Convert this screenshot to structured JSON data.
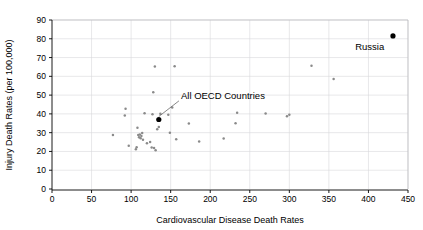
{
  "chart_data": {
    "type": "scatter",
    "title": "",
    "xlabel": "Cardiovascular Disease Death Rates",
    "ylabel": "Injury Death Rates (per 100,000)",
    "xlim": [
      0,
      450
    ],
    "ylim": [
      0,
      90
    ],
    "xticks": [
      0,
      50,
      100,
      150,
      200,
      250,
      300,
      350,
      400,
      450
    ],
    "yticks": [
      0,
      10,
      20,
      30,
      40,
      50,
      60,
      70,
      80,
      90
    ],
    "xtick_labels": [
      "0",
      "50",
      "100",
      "150",
      "200",
      "250",
      "300",
      "350",
      "400",
      "450"
    ],
    "ytick_labels": [
      "0",
      "10",
      "20",
      "30",
      "40",
      "50",
      "60",
      "70",
      "80",
      "90"
    ],
    "grid": true,
    "legend": "none",
    "series": [
      {
        "name": "OECD member countries",
        "marker": "small-gray-dot",
        "color": "#8a8a8a",
        "points": [
          [
            77,
            28.8
          ],
          [
            92,
            39.2
          ],
          [
            93,
            42.7
          ],
          [
            97,
            23.0
          ],
          [
            106,
            21.2
          ],
          [
            107,
            22.3
          ],
          [
            108,
            32.6
          ],
          [
            109,
            28.8
          ],
          [
            110,
            27.6
          ],
          [
            111,
            29.0
          ],
          [
            112,
            27.0
          ],
          [
            113,
            28.2
          ],
          [
            114,
            29.8
          ],
          [
            115,
            26.2
          ],
          [
            117,
            40.3
          ],
          [
            120,
            24.4
          ],
          [
            124,
            25.0
          ],
          [
            126,
            22.1
          ],
          [
            127,
            39.8
          ],
          [
            128,
            51.5
          ],
          [
            129,
            21.8
          ],
          [
            130,
            65.3
          ],
          [
            131,
            20.7
          ],
          [
            133,
            31.8
          ],
          [
            135,
            33.0
          ],
          [
            137,
            40.1
          ],
          [
            147,
            39.5
          ],
          [
            149,
            30.0
          ],
          [
            152,
            43.4
          ],
          [
            155,
            65.4
          ],
          [
            157,
            26.5
          ],
          [
            173,
            34.9
          ],
          [
            186,
            25.3
          ],
          [
            217,
            26.9
          ],
          [
            232,
            35.0
          ],
          [
            234,
            40.6
          ],
          [
            270,
            40.2
          ],
          [
            297,
            38.7
          ],
          [
            300,
            39.5
          ],
          [
            328,
            65.7
          ],
          [
            356,
            58.6
          ]
        ]
      },
      {
        "name": "Highlighted",
        "marker": "large-black-dot",
        "color": "#000000",
        "points": [
          [
            431,
            81.5
          ],
          [
            135,
            37.0
          ]
        ],
        "labels": [
          "Russia",
          "All OECD Countries"
        ]
      }
    ],
    "annotations": [
      {
        "text": "Russia",
        "point": [
          431,
          81.5
        ],
        "label_x": 420,
        "label_y": 74,
        "anchor": "end"
      },
      {
        "text": "All OECD Countries",
        "point": [
          135,
          37.0
        ],
        "label_x": 163,
        "label_y": 48,
        "anchor": "start"
      }
    ]
  },
  "figure": {
    "background_color": "#ffffff",
    "grid_color": "#d8d8dc",
    "point_color": "#8a8a8a",
    "highlight_color": "#000000"
  }
}
